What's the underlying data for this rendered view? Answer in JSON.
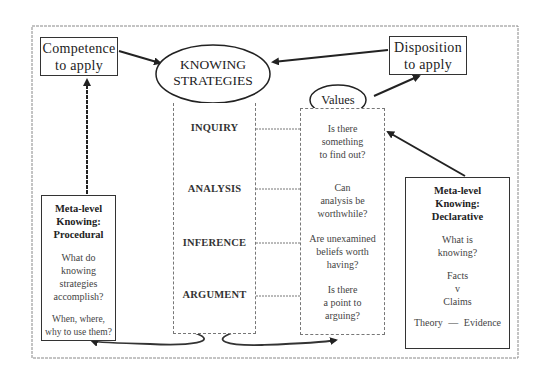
{
  "diagram": {
    "top_left_box": {
      "line1": "Competence",
      "line2": "to apply"
    },
    "top_right_box": {
      "line1": "Disposition",
      "line2": "to apply"
    },
    "center_ellipse": {
      "line1": "KNOWING",
      "line2": "STRATEGIES"
    },
    "values_ellipse": {
      "label": "Values"
    },
    "strategies": [
      {
        "label": "INQUIRY"
      },
      {
        "label": "ANALYSIS"
      },
      {
        "label": "INFERENCE"
      },
      {
        "label": "ARGUMENT"
      }
    ],
    "values_questions": [
      {
        "lines": [
          "Is there",
          "something",
          "to find out?"
        ]
      },
      {
        "lines": [
          "Can",
          "analysis be",
          "worthwhile?"
        ]
      },
      {
        "lines": [
          "Are unexamined",
          "beliefs worth",
          "having?"
        ]
      },
      {
        "lines": [
          "Is there",
          "a point to",
          "arguing?"
        ]
      }
    ],
    "procedural_box": {
      "title": [
        "Meta-level",
        "Knowing:",
        "Procedural"
      ],
      "question1": [
        "What do",
        "knowing",
        "strategies",
        "accomplish?"
      ],
      "question2": [
        "When, where,",
        "why to use them?"
      ]
    },
    "declarative_box": {
      "title": [
        "Meta-level",
        "Knowing:",
        "Declarative"
      ],
      "question": [
        "What is",
        "knowing?"
      ],
      "facts": "Facts",
      "versus": "v",
      "claims": "Claims",
      "theory": "Theory",
      "dash": "—",
      "evidence": "Evidence"
    }
  }
}
